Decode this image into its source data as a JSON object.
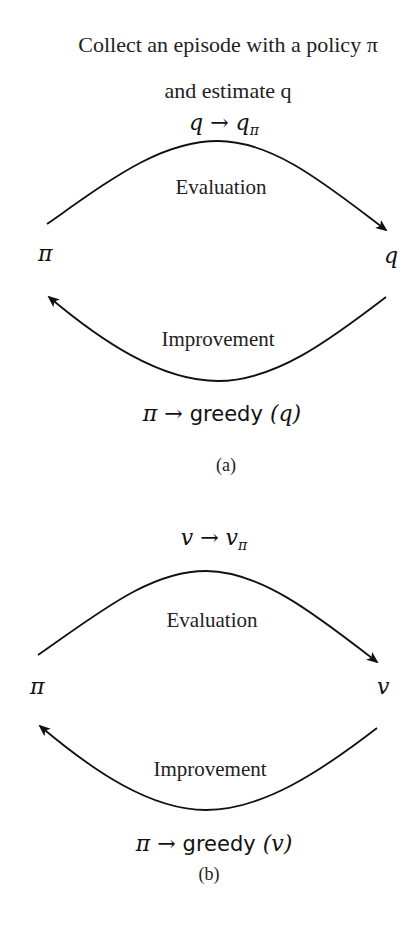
{
  "diagram_a": {
    "title_line1": "Collect an episode with a policy π",
    "title_line2": "and estimate q",
    "eval_formula_lhs": "q",
    "eval_formula_arrow": "→",
    "eval_formula_rhs": "q",
    "eval_formula_sub": "π",
    "evaluation_label": "Evaluation",
    "left_node": "π",
    "right_node": "q",
    "improvement_label": "Improvement",
    "improve_formula_lhs": "π",
    "improve_formula_arrow": "→",
    "improve_formula_word": "greedy",
    "improve_formula_arg": "(q)",
    "caption": "(a)"
  },
  "diagram_b": {
    "eval_formula_lhs": "v",
    "eval_formula_arrow": "→",
    "eval_formula_rhs": "v",
    "eval_formula_sub": "π",
    "evaluation_label": "Evaluation",
    "left_node": "π",
    "right_node": "v",
    "improvement_label": "Improvement",
    "improve_formula_lhs": "π",
    "improve_formula_arrow": "→",
    "improve_formula_word": "greedy",
    "improve_formula_arg": "(v)",
    "caption": "(b)"
  },
  "colors": {
    "stroke": "#111111",
    "text": "#222222",
    "background": "#ffffff"
  }
}
